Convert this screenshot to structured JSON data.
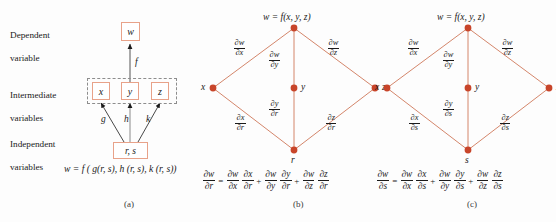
{
  "figure": {
    "background": "#fdfdfd",
    "node_color": "#c8452a",
    "edge_color": "#d4866b",
    "box_border_color": "#e8a289",
    "dashed_border_color": "#8d8d8d"
  },
  "panel_a": {
    "caption": "(a)",
    "row_labels": [
      {
        "name": "dependent",
        "line1": "Dependent",
        "line2": "variable"
      },
      {
        "name": "intermediate",
        "line1": "Intermediate",
        "line2": "variables"
      },
      {
        "name": "independent",
        "line1": "Independent",
        "line2": "variables"
      }
    ],
    "nodes": {
      "dependent": "w",
      "intermediate": [
        "x",
        "y",
        "z"
      ],
      "independent": "r, s"
    },
    "edge_labels": {
      "dependent_to_intermediate": "f",
      "independent_to_x": "g",
      "independent_to_y": "h",
      "independent_to_z": "k"
    },
    "equation": "w = f ( g(r, s), h (r, s), k (r, s))"
  },
  "panel_b": {
    "caption": "(b)",
    "top_node_label": "w = f(x, y, z)",
    "left_node_label": "x",
    "center_node_label": "y",
    "right_node_label": "z",
    "bottom_node_label": "r",
    "edges": [
      {
        "name": "w-x",
        "num": "∂w",
        "den": "∂x"
      },
      {
        "name": "w-y",
        "num": "∂w",
        "den": "∂y"
      },
      {
        "name": "w-z",
        "num": "∂w",
        "den": "∂z"
      },
      {
        "name": "x-r",
        "num": "∂x",
        "den": "∂r"
      },
      {
        "name": "y-r",
        "num": "∂y",
        "den": "∂r"
      },
      {
        "name": "z-r",
        "num": "∂z",
        "den": "∂r"
      }
    ],
    "equation": {
      "lhs": {
        "num": "∂w",
        "den": "∂r"
      },
      "eq": "=",
      "terms": [
        {
          "a": {
            "num": "∂w",
            "den": "∂x"
          },
          "b": {
            "num": "∂x",
            "den": "∂r"
          }
        },
        {
          "a": {
            "num": "∂w",
            "den": "∂y"
          },
          "b": {
            "num": "∂y",
            "den": "∂r"
          }
        },
        {
          "a": {
            "num": "∂w",
            "den": "∂z"
          },
          "b": {
            "num": "∂z",
            "den": "∂r"
          }
        }
      ],
      "plus": "+"
    }
  },
  "panel_c": {
    "caption": "(c)",
    "top_node_label": "w = f(x, y, z)",
    "left_node_label": "x",
    "center_node_label": "y",
    "right_node_label": "z",
    "bottom_node_label": "s",
    "edges": [
      {
        "name": "w-x",
        "num": "∂w",
        "den": "∂x"
      },
      {
        "name": "w-y",
        "num": "∂w",
        "den": "∂y"
      },
      {
        "name": "w-z",
        "num": "∂w",
        "den": "∂z"
      },
      {
        "name": "x-s",
        "num": "∂x",
        "den": "∂s"
      },
      {
        "name": "y-s",
        "num": "∂y",
        "den": "∂s"
      },
      {
        "name": "z-s",
        "num": "∂z",
        "den": "∂s"
      }
    ],
    "equation": {
      "lhs": {
        "num": "∂w",
        "den": "∂s"
      },
      "eq": "=",
      "terms": [
        {
          "a": {
            "num": "∂w",
            "den": "∂x"
          },
          "b": {
            "num": "∂x",
            "den": "∂s"
          }
        },
        {
          "a": {
            "num": "∂w",
            "den": "∂y"
          },
          "b": {
            "num": "∂y",
            "den": "∂s"
          }
        },
        {
          "a": {
            "num": "∂w",
            "den": "∂z"
          },
          "b": {
            "num": "∂z",
            "den": "∂s"
          }
        }
      ],
      "plus": "+"
    }
  }
}
